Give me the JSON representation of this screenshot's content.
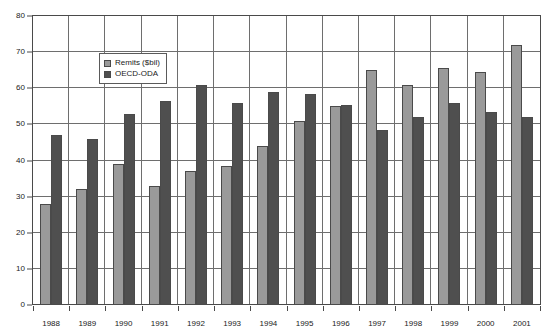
{
  "chart_data": {
    "type": "bar",
    "title": "",
    "xlabel": "",
    "ylabel": "",
    "ylim": [
      0,
      80
    ],
    "ytick_step": 10,
    "yticks": [
      "0",
      "10",
      "20",
      "30",
      "40",
      "50",
      "60",
      "70",
      "80"
    ],
    "grid": true,
    "legend_position": "top-left-inside",
    "categories": [
      "1988",
      "1989",
      "1990",
      "1991",
      "1992",
      "1993",
      "1994",
      "1995",
      "1996",
      "1997",
      "1998",
      "1999",
      "2000",
      "2001"
    ],
    "series": [
      {
        "name": "Remits ($bil)",
        "color": "#9a9a9a",
        "values": [
          28,
          32,
          39,
          33,
          37,
          38.5,
          44,
          51,
          55,
          65,
          61,
          65.5,
          64.5,
          72
        ]
      },
      {
        "name": "OECD-ODA",
        "color": "#4f4f4f",
        "values": [
          47,
          46,
          53,
          56.5,
          61,
          56,
          59,
          58.5,
          55.5,
          48.5,
          52,
          56,
          53.5,
          52
        ]
      }
    ]
  },
  "legend": {
    "items": [
      {
        "label": "Remits ($bil)",
        "swatch": "remits"
      },
      {
        "label": "OECD-ODA",
        "swatch": "oda"
      }
    ]
  },
  "colors": {
    "remits": "#9a9a9a",
    "oda": "#4f4f4f",
    "axis": "#4a4a4a",
    "grid": "#6e6e6e",
    "background": "#ffffff",
    "text": "#1a1a1a"
  }
}
